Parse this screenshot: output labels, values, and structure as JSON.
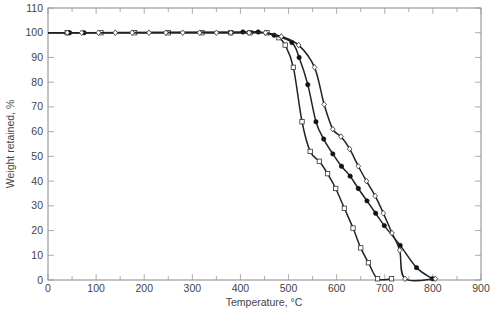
{
  "chart_data": {
    "type": "line",
    "title": "",
    "xlabel": "Temperature, °C",
    "ylabel": "Weight retained, %",
    "xlim": [
      0,
      900
    ],
    "ylim": [
      0,
      110
    ],
    "xticks": [
      0,
      100,
      200,
      300,
      400,
      500,
      600,
      700,
      800,
      900
    ],
    "yticks": [
      0,
      10,
      20,
      30,
      40,
      50,
      60,
      70,
      80,
      90,
      100,
      110
    ],
    "grid": false,
    "legend": null,
    "series": [
      {
        "name": "open squares",
        "marker": "square-open",
        "x": [
          0,
          40,
          110,
          180,
          250,
          320,
          380,
          420,
          455,
          480,
          493,
          510,
          528,
          545,
          564,
          581,
          598,
          616,
          634,
          650,
          666,
          685,
          714
        ],
        "y": [
          100,
          100,
          100,
          100,
          100,
          100,
          100,
          100,
          100,
          98,
          95,
          86,
          64,
          52,
          48,
          43,
          37,
          29,
          21,
          13,
          7,
          0.5,
          0.5
        ]
      },
      {
        "name": "filled circles",
        "marker": "circle-filled",
        "x": [
          0,
          45,
          75,
          405,
          437,
          470,
          507,
          522,
          540,
          557,
          573,
          592,
          610,
          628,
          645,
          663,
          681,
          699,
          732,
          766,
          799
        ],
        "y": [
          100,
          100,
          100,
          100.3,
          100.3,
          99,
          96,
          90,
          79,
          64,
          57,
          51,
          46,
          42,
          37,
          32,
          27,
          22,
          14,
          5,
          0.5
        ]
      },
      {
        "name": "open diamonds",
        "marker": "diamond-open",
        "x": [
          0,
          40,
          70,
          105,
          140,
          175,
          210,
          245,
          280,
          315,
          350,
          380,
          418,
          452,
          485,
          521,
          554,
          574,
          592,
          609,
          627,
          645,
          662,
          680,
          697,
          715,
          731,
          742,
          805
        ],
        "y": [
          100,
          100,
          100,
          100,
          100,
          100,
          100,
          100,
          100,
          100,
          100,
          100,
          100,
          100,
          98.5,
          95,
          86,
          71,
          61,
          58,
          53,
          46,
          40,
          34,
          27,
          19,
          12,
          0.5,
          0.5
        ]
      }
    ]
  }
}
